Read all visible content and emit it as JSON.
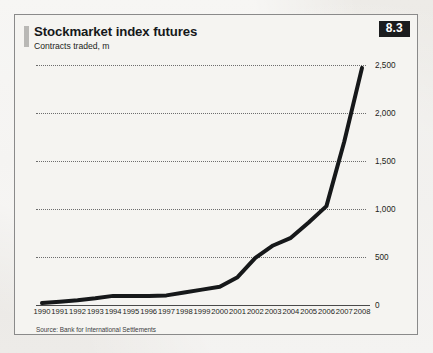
{
  "figure": {
    "badge": "8.3",
    "title": "Stockmarket index futures",
    "subtitle": "Contracts traded, m",
    "source": "Source: Bank for International Settlements"
  },
  "chart_data": {
    "type": "line",
    "title": "Stockmarket index futures",
    "subtitle": "Contracts traded, m",
    "xlabel": "",
    "ylabel": "Contracts traded, m",
    "ylim": [
      0,
      2500
    ],
    "xlim": [
      "1990",
      "2008"
    ],
    "yticks": [
      0,
      500,
      1000,
      1500,
      2000,
      2500
    ],
    "ytick_labels": [
      "0",
      "500",
      "1,000",
      "1,500",
      "2,000",
      "2,500"
    ],
    "ytick_position": "right",
    "grid": "horizontal-dotted",
    "legend": "none",
    "line_color": "#16181a",
    "line_width_px": 4,
    "categories": [
      "1990",
      "1991",
      "1992",
      "1993",
      "1994",
      "1995",
      "1996",
      "1997",
      "1998",
      "1999",
      "2000",
      "2001",
      "2002",
      "2003",
      "2004",
      "2005",
      "2006",
      "2007",
      "2008"
    ],
    "values": [
      20,
      35,
      50,
      70,
      95,
      95,
      95,
      100,
      130,
      160,
      190,
      290,
      490,
      620,
      700,
      860,
      1030,
      1700,
      2470
    ],
    "series": [
      {
        "name": "Contracts traded, m",
        "values": [
          20,
          35,
          50,
          70,
          95,
          95,
          95,
          100,
          130,
          160,
          190,
          290,
          490,
          620,
          700,
          860,
          1030,
          1700,
          2470
        ]
      }
    ]
  }
}
